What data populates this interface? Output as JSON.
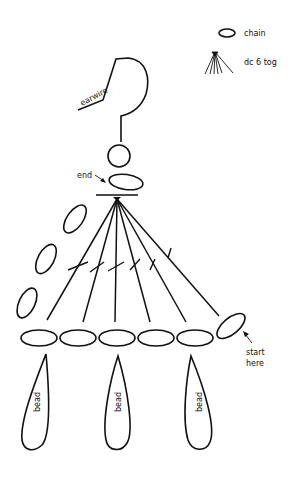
{
  "legend": {
    "items": [
      {
        "icon": "chain-oval-icon",
        "label": "chain"
      },
      {
        "icon": "dc-fan-icon",
        "label": "dc 6 tog"
      }
    ]
  },
  "labels": {
    "earwire": "earwire",
    "end": "end",
    "start_line1": "start",
    "start_line2": "here",
    "bead": "bead"
  },
  "diagram": {
    "stroke_color": "#111111",
    "background": "#ffffff",
    "bottom_chain_count": 5,
    "side_chain_count": 3,
    "fan_stitch_count": 6,
    "bead_count": 3
  }
}
